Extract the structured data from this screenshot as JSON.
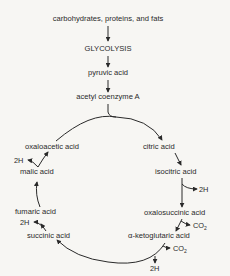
{
  "diagram": {
    "input_chain": [
      "carbohydrates, proteins, and fats",
      "GLYCOLYSIS",
      "pyruvic acid",
      "acetyl coenzyme A"
    ],
    "cycle": {
      "citric": "citric acid",
      "isocitric": "isocitric acid",
      "oxalosuccinic": "oxalosuccinic acid",
      "ketoglutaric": "α-ketoglutaric acid",
      "succinic": "succinic acid",
      "fumaric": "fumaric acid",
      "malic": "malic acid",
      "oxaloacetic": "oxaloacetic acid"
    },
    "byproducts": {
      "h_isocitric": "2H",
      "co2_oxalosuccinic": "CO",
      "co2_oxalosuccinic_sub": "2",
      "co2_ketoglutaric": "CO",
      "co2_ketoglutaric_sub": "2",
      "h_ketoglutaric": "2H",
      "h_succinic": "2H",
      "h_malic": "2H"
    }
  }
}
